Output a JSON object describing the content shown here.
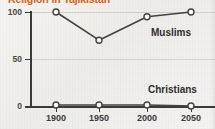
{
  "chart_data": {
    "type": "line",
    "title": "Religion in Tajikistan",
    "xlabel": "",
    "ylabel": "",
    "x": [
      1900,
      1950,
      2000,
      2050
    ],
    "categories": [
      "1900",
      "1950",
      "2000",
      "2050"
    ],
    "series": [
      {
        "name": "Muslims",
        "values": [
          100,
          70,
          95,
          100
        ]
      },
      {
        "name": "Christians",
        "values": [
          1,
          1,
          1,
          0
        ]
      }
    ],
    "xlim": [
      1900,
      2050
    ],
    "ylim": [
      0,
      100
    ],
    "ytick_labels": [
      "0",
      "50",
      "100"
    ],
    "ytick_values": [
      0,
      50,
      100
    ],
    "xtick_labels": [
      "1900",
      "1950",
      "2000",
      "2050"
    ],
    "grid": true,
    "legend_position": "inline-annotation",
    "annotations": [
      {
        "label": "Muslims",
        "series": "Muslims"
      },
      {
        "label": "Christians",
        "series": "Christians"
      }
    ],
    "colors": {
      "title": "#c8661e",
      "line": "#45423e",
      "marker_fill": "#fbfaf8",
      "axis": "#3b3a38",
      "grid": "#cfcdc8",
      "background": "#f2f1ef"
    }
  },
  "axes": {
    "y_labels": [
      {
        "text": "100",
        "value": 100
      },
      {
        "text": "50",
        "value": 50
      },
      {
        "text": "0",
        "value": 0
      }
    ],
    "x_labels": [
      {
        "text": "1900",
        "value": 1900
      },
      {
        "text": "1950",
        "value": 1950
      },
      {
        "text": "2000",
        "value": 2000
      },
      {
        "text": "2050",
        "value": 2050
      }
    ]
  }
}
